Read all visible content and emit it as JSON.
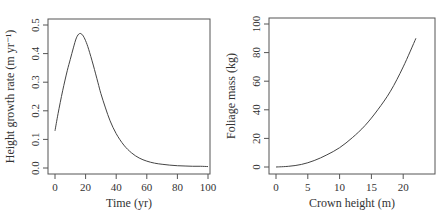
{
  "chart_data": [
    {
      "type": "line",
      "title": "",
      "xlabel": "Time (yr)",
      "ylabel": "Height growth rate (m yr⁻¹)",
      "xlim": [
        0,
        100
      ],
      "ylim": [
        0,
        0.5
      ],
      "x_ticks": [
        "0",
        "20",
        "40",
        "60",
        "80",
        "100"
      ],
      "y_ticks": [
        "0.0",
        "0.1",
        "0.2",
        "0.3",
        "0.4",
        "0.5"
      ],
      "grid": false,
      "legend": null,
      "series": [
        {
          "name": "height growth rate",
          "x": [
            0,
            2,
            5,
            8,
            10,
            12,
            14,
            16,
            18,
            20,
            22,
            25,
            28,
            30,
            33,
            36,
            40,
            45,
            50,
            55,
            60,
            65,
            70,
            75,
            80,
            85,
            90,
            95,
            100
          ],
          "y": [
            0.13,
            0.19,
            0.27,
            0.34,
            0.38,
            0.42,
            0.455,
            0.47,
            0.465,
            0.445,
            0.415,
            0.36,
            0.3,
            0.26,
            0.21,
            0.165,
            0.12,
            0.08,
            0.053,
            0.035,
            0.024,
            0.017,
            0.013,
            0.01,
            0.008,
            0.007,
            0.006,
            0.006,
            0.005
          ]
        }
      ]
    },
    {
      "type": "line",
      "title": "",
      "xlabel": "Crown height (m)",
      "ylabel": "Foliage mass (kg)",
      "xlim": [
        0,
        24
      ],
      "ylim": [
        0,
        100
      ],
      "x_ticks": [
        "0",
        "5",
        "10",
        "15",
        "20"
      ],
      "y_ticks": [
        "0",
        "20",
        "40",
        "60",
        "80",
        "100"
      ],
      "grid": false,
      "legend": null,
      "series": [
        {
          "name": "foliage mass",
          "x": [
            0,
            2,
            4,
            6,
            8,
            10,
            12,
            14,
            16,
            18,
            20,
            22
          ],
          "y": [
            0,
            0.5,
            1.8,
            4.5,
            8.5,
            13.5,
            20.5,
            29,
            40,
            53,
            70,
            90
          ]
        }
      ]
    }
  ]
}
